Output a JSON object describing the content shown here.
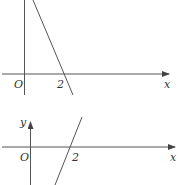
{
  "graphs": [
    {
      "id": "top",
      "axis_labels": {
        "x": "x"
      },
      "origin_label": "O",
      "intercept_label": "2",
      "line": {
        "slope_sign": "negative",
        "x_intercept": 2
      }
    },
    {
      "id": "bottom",
      "axis_labels": {
        "x": "x",
        "y": "y"
      },
      "origin_label": "O",
      "intercept_label": "2",
      "line": {
        "slope_sign": "positive",
        "x_intercept": 2
      }
    }
  ],
  "colors": {
    "stroke": "#555555",
    "text": "#333333"
  }
}
